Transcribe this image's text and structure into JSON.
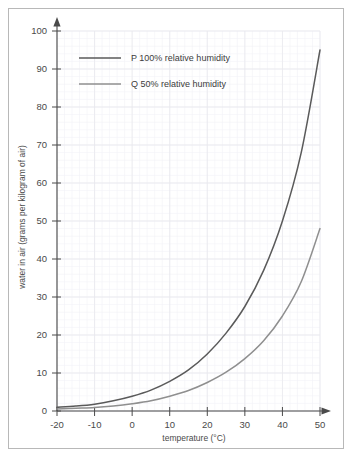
{
  "figure": {
    "background_color": "#ffffff",
    "border_color": "#b8b8b8"
  },
  "chart_data": {
    "type": "line",
    "title": "",
    "xlabel": "temperature (°C)",
    "ylabel": "water in air (grams per kilogram of air)",
    "xlim": [
      -20,
      50
    ],
    "ylim": [
      0,
      100
    ],
    "xticks": [
      -20,
      -10,
      0,
      10,
      20,
      30,
      40,
      50
    ],
    "yticks": [
      0,
      10,
      20,
      30,
      40,
      50,
      60,
      70,
      80,
      90,
      100
    ],
    "xtick_labels": [
      "-20",
      "-10",
      "0",
      "10",
      "20",
      "30",
      "40",
      "50"
    ],
    "ytick_labels": [
      "0",
      "10",
      "20",
      "30",
      "40",
      "50",
      "60",
      "70",
      "80",
      "90",
      "100"
    ],
    "x_minor_step": 2,
    "y_minor_step": 2,
    "grid": true,
    "grid_color": "#e8e8ee",
    "minor_grid_color": "#f2f2f6",
    "legend_position": "upper-left",
    "x": [
      -20,
      -15,
      -10,
      -5,
      0,
      5,
      10,
      15,
      20,
      25,
      30,
      35,
      40,
      45,
      50
    ],
    "series": [
      {
        "name": "P 100% relative humidity",
        "key": "P",
        "color": "#5a5a5a",
        "values": [
          1.0,
          1.3,
          1.8,
          2.7,
          3.9,
          5.5,
          7.8,
          10.8,
          15.0,
          20.5,
          27.5,
          37.0,
          50.0,
          68.0,
          95.0
        ]
      },
      {
        "name": "Q 50% relative humidity",
        "key": "Q",
        "color": "#8f8f8f",
        "values": [
          0.5,
          0.7,
          0.9,
          1.3,
          1.9,
          2.7,
          3.9,
          5.4,
          7.5,
          10.2,
          13.8,
          18.5,
          25.0,
          34.0,
          48.0
        ]
      }
    ]
  },
  "legend": {
    "entries": [
      {
        "label": "P 100% relative humidity",
        "color": "#5a5a5a"
      },
      {
        "label": "Q 50% relative humidity",
        "color": "#8f8f8f"
      }
    ]
  },
  "axes": {
    "x_axis_label": "temperature (°C)",
    "y_axis_label": "water in air (grams per kilogram of air)",
    "axis_color": "#4a4a4a"
  }
}
